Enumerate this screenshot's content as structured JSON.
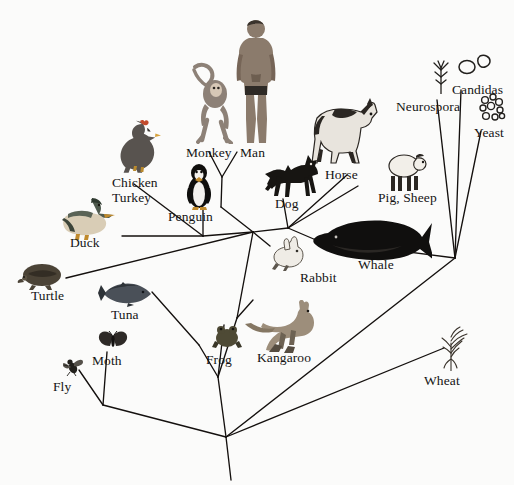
{
  "figure": {
    "kind": "phylogenetic-tree",
    "title": "",
    "background_color": "#fbfbfa",
    "line_color": "#14100e",
    "text_color": "#141414",
    "width": 514,
    "height": 485
  },
  "taxa": [
    {
      "id": "chicken-turkey",
      "label": "Chicken\nTurkey",
      "label_x": 112,
      "label_y": 176,
      "icon": "chicken-icon",
      "icon_x": 112,
      "icon_y": 118,
      "icon_w": 52,
      "icon_h": 56
    },
    {
      "id": "monkey",
      "label": "Monkey",
      "label_x": 186,
      "label_y": 146,
      "icon": "monkey-icon",
      "icon_x": 185,
      "icon_y": 60,
      "icon_w": 54,
      "icon_h": 84
    },
    {
      "id": "man",
      "label": "Man",
      "label_x": 240,
      "label_y": 146,
      "icon": "man-icon",
      "icon_x": 233,
      "icon_y": 18,
      "icon_w": 46,
      "icon_h": 126
    },
    {
      "id": "horse",
      "label": "Horse",
      "label_x": 325,
      "label_y": 168,
      "icon": "horse-icon",
      "icon_x": 305,
      "icon_y": 88,
      "icon_w": 80,
      "icon_h": 78
    },
    {
      "id": "neurospora",
      "label": "Neurospora",
      "label_x": 396,
      "label_y": 100,
      "icon": "neurospora-icon",
      "icon_x": 430,
      "icon_y": 58,
      "icon_w": 22,
      "icon_h": 36
    },
    {
      "id": "candidas",
      "label": "Candidas",
      "label_x": 452,
      "label_y": 83,
      "icon": "candidas-icon",
      "icon_x": 458,
      "icon_y": 52,
      "icon_w": 34,
      "icon_h": 24
    },
    {
      "id": "yeast",
      "label": "Yeast",
      "label_x": 474,
      "label_y": 126,
      "icon": "yeast-icon",
      "icon_x": 477,
      "icon_y": 93,
      "icon_w": 30,
      "icon_h": 30
    },
    {
      "id": "pig-sheep",
      "label": "Pig, Sheep",
      "label_x": 378,
      "label_y": 191,
      "icon": "sheep-icon",
      "icon_x": 383,
      "icon_y": 150,
      "icon_w": 46,
      "icon_h": 42
    },
    {
      "id": "dog",
      "label": "Dog",
      "label_x": 275,
      "label_y": 197,
      "icon": "dog-icon",
      "icon_x": 264,
      "icon_y": 152,
      "icon_w": 58,
      "icon_h": 46
    },
    {
      "id": "penguin",
      "label": "Penguin",
      "label_x": 168,
      "label_y": 210,
      "icon": "penguin-icon",
      "icon_x": 184,
      "icon_y": 162,
      "icon_w": 30,
      "icon_h": 48
    },
    {
      "id": "duck",
      "label": "Duck",
      "label_x": 70,
      "label_y": 236,
      "icon": "duck-icon",
      "icon_x": 58,
      "icon_y": 196,
      "icon_w": 62,
      "icon_h": 44
    },
    {
      "id": "whale",
      "label": "Whale",
      "label_x": 358,
      "label_y": 258,
      "icon": "whale-icon",
      "icon_x": 308,
      "icon_y": 215,
      "icon_w": 124,
      "icon_h": 48
    },
    {
      "id": "rabbit",
      "label": "Rabbit",
      "label_x": 300,
      "label_y": 271,
      "icon": "rabbit-icon",
      "icon_x": 268,
      "icon_y": 235,
      "icon_w": 40,
      "icon_h": 36
    },
    {
      "id": "turtle",
      "label": "Turtle",
      "label_x": 31,
      "label_y": 289,
      "icon": "turtle-icon",
      "icon_x": 14,
      "icon_y": 262,
      "icon_w": 52,
      "icon_h": 30
    },
    {
      "id": "tuna",
      "label": "Tuna",
      "label_x": 111,
      "label_y": 308,
      "icon": "tuna-icon",
      "icon_x": 98,
      "icon_y": 280,
      "icon_w": 56,
      "icon_h": 28
    },
    {
      "id": "moth",
      "label": "Moth",
      "label_x": 92,
      "label_y": 354,
      "icon": "moth-icon",
      "icon_x": 98,
      "icon_y": 330,
      "icon_w": 30,
      "icon_h": 22
    },
    {
      "id": "frog",
      "label": "Frog",
      "label_x": 206,
      "label_y": 353,
      "icon": "frog-icon",
      "icon_x": 212,
      "icon_y": 322,
      "icon_w": 30,
      "icon_h": 28
    },
    {
      "id": "kangaroo",
      "label": "Kangaroo",
      "label_x": 257,
      "label_y": 351,
      "icon": "kangaroo-icon",
      "icon_x": 245,
      "icon_y": 300,
      "icon_w": 76,
      "icon_h": 54
    },
    {
      "id": "wheat",
      "label": "Wheat",
      "label_x": 424,
      "label_y": 374,
      "icon": "wheat-icon",
      "icon_x": 437,
      "icon_y": 325,
      "icon_w": 34,
      "icon_h": 46
    },
    {
      "id": "fly",
      "label": "Fly",
      "label_x": 53,
      "label_y": 380,
      "icon": "fly-icon",
      "icon_x": 63,
      "icon_y": 356,
      "icon_w": 20,
      "icon_h": 20
    }
  ],
  "edges": [
    {
      "id": "edge-chicken-turkey",
      "from": [
        134,
        184
      ],
      "to": [
        203,
        236
      ]
    },
    {
      "id": "edge-penguin",
      "from": [
        203,
        210
      ],
      "to": [
        203,
        236
      ]
    },
    {
      "id": "edge-duck",
      "from": [
        122,
        236
      ],
      "to": [
        203,
        236
      ]
    },
    {
      "id": "edge-birds-stem",
      "from": [
        203,
        236
      ],
      "to": [
        253,
        232
      ]
    },
    {
      "id": "edge-monkey",
      "from": [
        209,
        152
      ],
      "to": [
        222,
        177
      ]
    },
    {
      "id": "edge-man",
      "from": [
        237,
        152
      ],
      "to": [
        222,
        177
      ]
    },
    {
      "id": "edge-primates-stem",
      "from": [
        222,
        177
      ],
      "to": [
        221,
        207
      ]
    },
    {
      "id": "edge-primates-down",
      "from": [
        221,
        207
      ],
      "to": [
        253,
        232
      ]
    },
    {
      "id": "edge-dog",
      "from": [
        283,
        199
      ],
      "to": [
        288,
        228
      ]
    },
    {
      "id": "edge-horse",
      "from": [
        347,
        175
      ],
      "to": [
        288,
        228
      ]
    },
    {
      "id": "edge-pigsheep",
      "from": [
        358,
        186
      ],
      "to": [
        288,
        228
      ]
    },
    {
      "id": "edge-whale",
      "from": [
        316,
        240
      ],
      "to": [
        288,
        228
      ]
    },
    {
      "id": "edge-mammal-stem",
      "from": [
        288,
        228
      ],
      "to": [
        253,
        232
      ]
    },
    {
      "id": "edge-rabbit",
      "from": [
        270,
        246
      ],
      "to": [
        253,
        232
      ]
    },
    {
      "id": "edge-turtle",
      "from": [
        66,
        278
      ],
      "to": [
        253,
        232
      ]
    },
    {
      "id": "edge-amniote-down",
      "from": [
        253,
        232
      ],
      "to": [
        237,
        318
      ]
    },
    {
      "id": "edge-kangaroo",
      "from": [
        253,
        300
      ],
      "to": [
        237,
        318
      ]
    },
    {
      "id": "edge-frog",
      "from": [
        224,
        325
      ],
      "to": [
        218,
        377
      ]
    },
    {
      "id": "edge-tuna",
      "from": [
        152,
        292
      ],
      "to": [
        199,
        345
      ]
    },
    {
      "id": "edge-tuna-lower",
      "from": [
        199,
        345
      ],
      "to": [
        218,
        377
      ]
    },
    {
      "id": "edge-vert-stem",
      "from": [
        237,
        318
      ],
      "to": [
        218,
        377
      ]
    },
    {
      "id": "edge-vert-root",
      "from": [
        218,
        377
      ],
      "to": [
        226,
        437
      ]
    },
    {
      "id": "edge-fly",
      "from": [
        79,
        370
      ],
      "to": [
        103,
        405
      ]
    },
    {
      "id": "edge-moth",
      "from": [
        107,
        352
      ],
      "to": [
        103,
        405
      ]
    },
    {
      "id": "edge-insect-stem",
      "from": [
        103,
        405
      ],
      "to": [
        226,
        437
      ]
    },
    {
      "id": "edge-root-trunk",
      "from": [
        226,
        437
      ],
      "to": [
        231,
        480
      ]
    },
    {
      "id": "edge-neurospora",
      "from": [
        437,
        100
      ],
      "to": [
        455,
        258
      ]
    },
    {
      "id": "edge-candidas",
      "from": [
        461,
        90
      ],
      "to": [
        455,
        258
      ]
    },
    {
      "id": "edge-yeast",
      "from": [
        481,
        131
      ],
      "to": [
        455,
        258
      ]
    },
    {
      "id": "edge-fungi-whale",
      "from": [
        455,
        258
      ],
      "to": [
        316,
        240
      ]
    },
    {
      "id": "edge-fungi-root",
      "from": [
        455,
        258
      ],
      "to": [
        226,
        437
      ]
    },
    {
      "id": "edge-wheat",
      "from": [
        444,
        348
      ],
      "to": [
        226,
        437
      ]
    }
  ]
}
